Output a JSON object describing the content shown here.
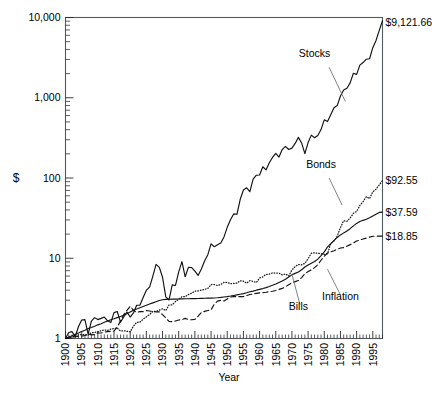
{
  "chart_data": {
    "type": "line",
    "title": "",
    "xlabel": "Year",
    "ylabel": "$",
    "yscale": "log",
    "ylim": [
      1,
      10000
    ],
    "xlim": [
      1900,
      1998
    ],
    "grid": false,
    "legend_position": "inline-annotations",
    "ytick_labels": [
      "1",
      "10",
      "100",
      "1,000",
      "10,000"
    ],
    "ytick_values": [
      1,
      10,
      100,
      1000,
      10000
    ],
    "xtick_labels": [
      "1900",
      "1905",
      "1910",
      "1915",
      "1920",
      "1925",
      "1930",
      "1935",
      "1940",
      "1945",
      "1950",
      "1955",
      "1960",
      "1965",
      "1970",
      "1975",
      "1980",
      "1985",
      "1990",
      "1995"
    ],
    "xtick_values": [
      1900,
      1905,
      1910,
      1915,
      1920,
      1925,
      1930,
      1935,
      1940,
      1945,
      1950,
      1955,
      1960,
      1965,
      1970,
      1975,
      1980,
      1985,
      1990,
      1995
    ],
    "annotations": [
      {
        "name": "stocks-label",
        "text": "Stocks",
        "x": 1977,
        "y": 3200
      },
      {
        "name": "bonds-label",
        "text": "Bonds",
        "x": 1979,
        "y": 135
      },
      {
        "name": "bills-label",
        "text": "Bills",
        "x": 1972,
        "y": 2.25
      },
      {
        "name": "inflation-label",
        "text": "Inflation",
        "x": 1985,
        "y": 3.0
      }
    ],
    "end_value_labels": [
      {
        "name": "stocks-end-value",
        "text": "$9,121.66",
        "value": 9121.66,
        "series": "Stocks"
      },
      {
        "name": "bonds-end-value",
        "text": "$92.55",
        "value": 92.55,
        "series": "Bonds"
      },
      {
        "name": "bills-end-value",
        "text": "$37.59",
        "value": 37.59,
        "series": "Bills"
      },
      {
        "name": "inflation-end-value",
        "text": "$18.85",
        "value": 18.85,
        "series": "Inflation"
      }
    ],
    "x": [
      1900,
      1901,
      1902,
      1903,
      1904,
      1905,
      1906,
      1907,
      1908,
      1909,
      1910,
      1911,
      1912,
      1913,
      1914,
      1915,
      1916,
      1917,
      1918,
      1919,
      1920,
      1921,
      1922,
      1923,
      1924,
      1925,
      1926,
      1927,
      1928,
      1929,
      1930,
      1931,
      1932,
      1933,
      1934,
      1935,
      1936,
      1937,
      1938,
      1939,
      1940,
      1941,
      1942,
      1943,
      1944,
      1945,
      1946,
      1947,
      1948,
      1949,
      1950,
      1951,
      1952,
      1953,
      1954,
      1955,
      1956,
      1957,
      1958,
      1959,
      1960,
      1961,
      1962,
      1963,
      1964,
      1965,
      1966,
      1967,
      1968,
      1969,
      1970,
      1971,
      1972,
      1973,
      1974,
      1975,
      1976,
      1977,
      1978,
      1979,
      1980,
      1981,
      1982,
      1983,
      1984,
      1985,
      1986,
      1987,
      1988,
      1989,
      1990,
      1991,
      1992,
      1993,
      1994,
      1995,
      1996,
      1997,
      1998
    ],
    "series": [
      {
        "name": "Stocks",
        "style": "solid",
        "values": [
          1.0,
          1.19,
          1.22,
          1.05,
          1.4,
          1.7,
          1.72,
          1.13,
          1.65,
          1.82,
          1.72,
          1.78,
          1.85,
          1.66,
          1.58,
          2.1,
          2.17,
          1.6,
          1.85,
          2.14,
          1.85,
          2.08,
          2.6,
          2.6,
          3.25,
          4.0,
          4.37,
          6.0,
          8.4,
          7.7,
          5.8,
          3.3,
          3.02,
          4.65,
          4.58,
          6.76,
          9.06,
          5.88,
          7.7,
          7.66,
          6.91,
          6.11,
          7.35,
          9.25,
          11.08,
          15.12,
          13.9,
          14.71,
          15.51,
          18.44,
          24.3,
          30.11,
          35.66,
          35.32,
          53.9,
          70.93,
          75.56,
          67.43,
          96.75,
          108.31,
          108.86,
          138.15,
          126.07,
          154.83,
          180.31,
          202.79,
          182.33,
          226.05,
          247.74,
          226.7,
          235.78,
          269.47,
          320.7,
          273.57,
          201.13,
          276.11,
          342.17,
          317.76,
          338.57,
          401.13,
          531.05,
          505.13,
          613.68,
          752.22,
          799.11,
          1052.93,
          1249.49,
          1315.17,
          1533.21,
          2018.83,
          1956.05,
          2552.07,
          2746.62,
          3022.8,
          3062.31,
          4211.57,
          5179.1,
          6906.03,
          9121.66
        ]
      },
      {
        "name": "Bonds",
        "style": "dotted",
        "values": [
          1.0,
          1.02,
          1.05,
          1.06,
          1.11,
          1.12,
          1.11,
          1.1,
          1.18,
          1.19,
          1.21,
          1.25,
          1.28,
          1.26,
          1.31,
          1.33,
          1.35,
          1.24,
          1.25,
          1.23,
          1.21,
          1.42,
          1.59,
          1.6,
          1.74,
          1.86,
          1.99,
          2.17,
          2.18,
          2.25,
          2.35,
          2.23,
          2.61,
          2.63,
          2.89,
          3.09,
          3.32,
          3.32,
          3.53,
          3.67,
          3.89,
          3.92,
          4.01,
          4.09,
          4.21,
          4.69,
          4.7,
          4.56,
          4.71,
          4.99,
          5.0,
          4.81,
          4.86,
          4.89,
          5.25,
          5.18,
          4.89,
          5.26,
          5.15,
          4.99,
          5.67,
          5.86,
          6.3,
          6.35,
          6.57,
          6.54,
          6.53,
          6.2,
          6.36,
          6.03,
          7.13,
          7.91,
          8.36,
          8.29,
          8.63,
          9.89,
          11.54,
          11.69,
          11.55,
          11.38,
          11.15,
          11.4,
          15.21,
          16.47,
          18.76,
          24.12,
          29.33,
          28.8,
          31.69,
          36.29,
          38.31,
          45.51,
          50.71,
          58.52,
          55.29,
          67.35,
          72.4,
          82.22,
          92.55
        ]
      },
      {
        "name": "Bills",
        "style": "solid-smooth",
        "values": [
          1.0,
          1.04,
          1.08,
          1.13,
          1.17,
          1.22,
          1.27,
          1.33,
          1.37,
          1.42,
          1.48,
          1.53,
          1.59,
          1.65,
          1.71,
          1.76,
          1.82,
          1.88,
          1.95,
          2.03,
          2.14,
          2.25,
          2.33,
          2.42,
          2.51,
          2.6,
          2.69,
          2.78,
          2.87,
          2.97,
          3.04,
          3.07,
          3.08,
          3.09,
          3.1,
          3.11,
          3.12,
          3.13,
          3.13,
          3.14,
          3.14,
          3.15,
          3.16,
          3.17,
          3.18,
          3.19,
          3.2,
          3.22,
          3.25,
          3.29,
          3.33,
          3.38,
          3.44,
          3.5,
          3.56,
          3.62,
          3.71,
          3.83,
          3.89,
          4.0,
          4.1,
          4.19,
          4.3,
          4.44,
          4.6,
          4.78,
          4.99,
          5.2,
          5.47,
          5.83,
          6.21,
          6.48,
          6.73,
          7.2,
          7.78,
          8.23,
          8.66,
          9.1,
          9.76,
          10.78,
          12.0,
          13.79,
          15.23,
          16.55,
          18.17,
          19.53,
          20.71,
          21.86,
          23.37,
          25.3,
          27.19,
          28.67,
          29.68,
          30.56,
          31.91,
          33.68,
          35.38,
          37.23,
          37.59
        ]
      },
      {
        "name": "Inflation",
        "style": "dashed",
        "values": [
          1.0,
          1.02,
          1.04,
          1.05,
          1.06,
          1.07,
          1.09,
          1.14,
          1.11,
          1.12,
          1.17,
          1.17,
          1.2,
          1.22,
          1.23,
          1.24,
          1.39,
          1.65,
          1.98,
          2.24,
          2.52,
          2.25,
          2.11,
          2.16,
          2.16,
          2.23,
          2.2,
          2.16,
          2.15,
          2.15,
          1.98,
          1.81,
          1.63,
          1.62,
          1.65,
          1.7,
          1.72,
          1.78,
          1.72,
          1.71,
          1.73,
          1.9,
          2.11,
          2.18,
          2.23,
          2.28,
          2.68,
          2.92,
          2.99,
          2.93,
          3.1,
          3.29,
          3.32,
          3.34,
          3.32,
          3.33,
          3.43,
          3.53,
          3.59,
          3.65,
          3.7,
          3.73,
          3.77,
          3.83,
          3.88,
          3.96,
          4.09,
          4.21,
          4.41,
          4.68,
          4.94,
          5.11,
          5.28,
          5.74,
          6.38,
          6.83,
          7.16,
          7.64,
          8.33,
          9.44,
          10.61,
          11.55,
          11.99,
          12.43,
          12.92,
          13.41,
          13.56,
          14.15,
          14.78,
          15.46,
          16.4,
          16.9,
          17.38,
          17.86,
          18.34,
          18.8,
          18.85,
          18.85,
          18.85
        ]
      }
    ]
  }
}
